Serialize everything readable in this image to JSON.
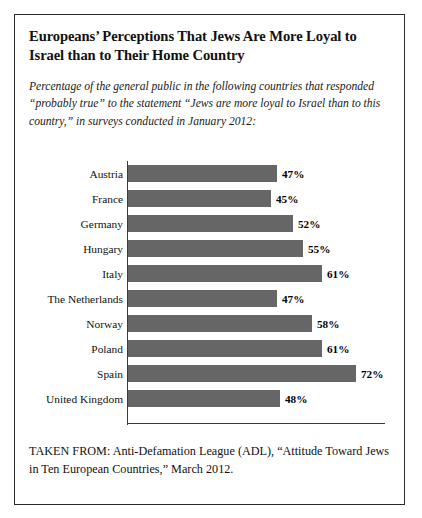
{
  "figure": {
    "title": "Europeans’ Perceptions That Jews Are More Loyal to Israel than to Their Home Country",
    "subtitle": "Percentage of the general public in the following countries that responded “probably true” to the statement “Jews are more loyal to Israel than to this country,” in surveys conducted in January 2012:",
    "source": "TAKEN FROM: Anti-Defamation League (ADL), “Attitude Toward Jews in Ten European Countries,” March 2012."
  },
  "chart_data": {
    "type": "bar",
    "orientation": "horizontal",
    "title": "Europeans’ Perceptions That Jews Are More Loyal to Israel than to Their Home Country",
    "subtitle": "Percentage of the general public in the following countries that responded “probably true” to the statement “Jews are more loyal to Israel than to this country,” in surveys conducted in January 2012:",
    "xlabel": "",
    "ylabel": "",
    "xlim": [
      0,
      81
    ],
    "grid": false,
    "legend": "none",
    "bar_color": "#666666",
    "axis_color": "#3b3b3b",
    "value_suffix": "%",
    "categories": [
      "Austria",
      "France",
      "Germany",
      "Hungary",
      "Italy",
      "The Netherlands",
      "Norway",
      "Poland",
      "Spain",
      "United Kingdom"
    ],
    "values": [
      47,
      45,
      52,
      55,
      61,
      47,
      58,
      61,
      72,
      48
    ],
    "labels": [
      "47%",
      "45%",
      "52%",
      "55%",
      "61%",
      "47%",
      "58%",
      "61%",
      "72%",
      "48%"
    ],
    "points": [
      {
        "category": "Austria",
        "value": 47,
        "label": "47%"
      },
      {
        "category": "France",
        "value": 45,
        "label": "45%"
      },
      {
        "category": "Germany",
        "value": 52,
        "label": "52%"
      },
      {
        "category": "Hungary",
        "value": 55,
        "label": "55%"
      },
      {
        "category": "Italy",
        "value": 61,
        "label": "61%"
      },
      {
        "category": "The Netherlands",
        "value": 47,
        "label": "47%"
      },
      {
        "category": "Norway",
        "value": 58,
        "label": "58%"
      },
      {
        "category": "Poland",
        "value": 61,
        "label": "61%"
      },
      {
        "category": "Spain",
        "value": 72,
        "label": "72%"
      },
      {
        "category": "United Kingdom",
        "value": 48,
        "label": "48%"
      }
    ]
  }
}
